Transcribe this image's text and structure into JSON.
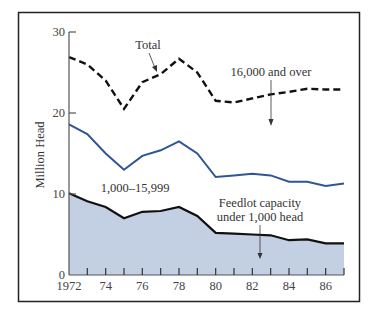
{
  "chart_data": {
    "type": "area",
    "title": "",
    "xlabel": "",
    "ylabel": "Million Head",
    "x": [
      1972,
      1973,
      1974,
      1975,
      1976,
      1977,
      1978,
      1979,
      1980,
      1981,
      1982,
      1983,
      1984,
      1985,
      1986,
      1987
    ],
    "xticks": [
      1972,
      1973,
      1974,
      1975,
      1976,
      1977,
      1978,
      1979,
      1980,
      1981,
      1982,
      1983,
      1984,
      1985,
      1986,
      1987
    ],
    "xtick_labels": [
      "1972",
      "",
      "74",
      "",
      "76",
      "",
      "78",
      "",
      "80",
      "",
      "82",
      "",
      "84",
      "",
      "86",
      ""
    ],
    "yticks": [
      0,
      10,
      20,
      30
    ],
    "ytick_labels": [
      "0",
      "10",
      "20",
      "30"
    ],
    "ylim": [
      0,
      30
    ],
    "xlim": [
      1972,
      1987
    ],
    "grid": false,
    "legend": "annotations",
    "series": [
      {
        "name": "Total",
        "style": "dashed-black",
        "label": "16,000 and over",
        "values": [
          26.9,
          26.0,
          24.0,
          20.5,
          23.8,
          24.8,
          26.7,
          25.0,
          21.5,
          21.3,
          21.8,
          22.3,
          22.6,
          23.0,
          22.9,
          22.9
        ]
      },
      {
        "name": "1,000-15,999 (cumulative)",
        "style": "solid-blue",
        "values": [
          18.6,
          17.4,
          15.0,
          13.0,
          14.7,
          15.4,
          16.5,
          15.0,
          12.1,
          12.3,
          12.5,
          12.3,
          11.5,
          11.5,
          11.0,
          11.3
        ]
      },
      {
        "name": "Feedlot capacity under 1,000 head",
        "style": "solid-black-filled",
        "values": [
          10.1,
          9.1,
          8.4,
          7.0,
          7.8,
          7.9,
          8.4,
          7.3,
          5.2,
          5.1,
          5.0,
          4.9,
          4.3,
          4.4,
          3.9,
          3.9
        ]
      }
    ],
    "annotations": [
      "Total",
      "16,000 and over",
      "1,000–15,999",
      "Feedlot capacity",
      "under 1,000 head"
    ]
  },
  "labels": {
    "ylabel": "Million Head",
    "total": "Total",
    "over16k": "16,000 and over",
    "mid": "1,000–15,999",
    "feedlot1": "Feedlot capacity",
    "feedlot2": "under 1,000 head"
  },
  "ticks": {
    "y": [
      "0",
      "10",
      "20",
      "30"
    ],
    "x": [
      "1972",
      "74",
      "76",
      "78",
      "80",
      "82",
      "84",
      "86"
    ]
  },
  "colors": {
    "fill": "#c3cfe2",
    "blue_line": "#2f5597",
    "black_line": "#111111",
    "frame": "#222222"
  }
}
